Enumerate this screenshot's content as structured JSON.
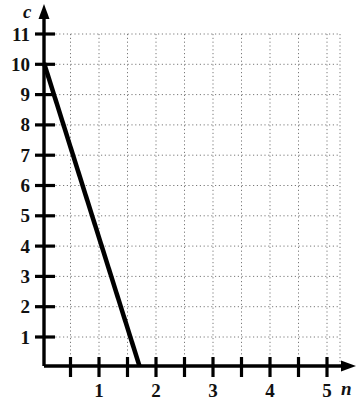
{
  "chart_data": {
    "type": "line",
    "title": "",
    "xlabel": "n",
    "ylabel": "c",
    "xlim": [
      0,
      5.25
    ],
    "ylim": [
      0,
      11.4
    ],
    "grid": true,
    "grid_style": "dotted",
    "x_major_step": 1,
    "x_minor_step": 0.5,
    "y_major_step": 1,
    "legend": "none",
    "x_tick_labels": [
      "1",
      "2",
      "3",
      "4",
      "5"
    ],
    "x_tick_values": [
      1,
      2,
      3,
      4,
      5
    ],
    "x_minor_tick_values": [
      0.5,
      1,
      1.5,
      2,
      2.5,
      3,
      3.5,
      4,
      4.5,
      5
    ],
    "y_tick_labels": [
      "11",
      "10",
      "9",
      "8",
      "7",
      "6",
      "5",
      "4",
      "3",
      "2",
      "1"
    ],
    "y_tick_values": [
      11,
      10,
      9,
      8,
      7,
      6,
      5,
      4,
      3,
      2,
      1
    ],
    "series": [
      {
        "name": "line",
        "color": "#000000",
        "line_width": 4.5,
        "points": [
          {
            "n": 0,
            "c": 10
          },
          {
            "n": 3.35,
            "c": 0
          }
        ],
        "slope": -3,
        "intercept": 10,
        "x_intercept": 3.35
      }
    ],
    "annotations": []
  },
  "axes": {
    "y_axis_name": "c",
    "x_axis_name": "n"
  }
}
